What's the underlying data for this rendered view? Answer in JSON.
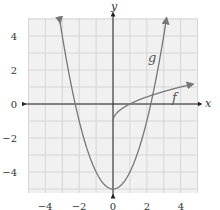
{
  "chart_data": {
    "type": "line",
    "title": "",
    "xlabel": "x",
    "ylabel": "y",
    "xlim": [
      -5,
      5
    ],
    "ylim": [
      -5,
      5
    ],
    "grid": true,
    "xticks": [
      -4,
      -2,
      0,
      2,
      4
    ],
    "yticks": [
      -4,
      -2,
      0,
      2,
      4
    ],
    "xtick_labels": [
      "−4",
      "−2",
      "0",
      "2",
      "4"
    ],
    "ytick_labels": [
      "4",
      "2",
      "0",
      "−2",
      "−4"
    ],
    "series": [
      {
        "name": "g",
        "formula": "x^2 - 5",
        "x": [
          -3.15,
          -3,
          -2.5,
          -2,
          -1.5,
          -1,
          -0.5,
          0,
          0.5,
          1,
          1.5,
          2,
          2.5,
          3,
          3.15
        ],
        "y": [
          4.9,
          4,
          1.25,
          -1,
          -2.75,
          -4,
          -4.75,
          -5,
          -4.75,
          -4,
          -2.75,
          -1,
          1.25,
          4,
          4.9
        ],
        "arrows": "both-ends"
      },
      {
        "name": "f",
        "formula": "sqrt(x) - 1",
        "x": [
          0,
          0.25,
          0.5,
          1,
          1.5,
          2,
          2.5,
          3,
          3.5,
          4,
          4.6
        ],
        "y": [
          -1,
          -0.5,
          -0.29,
          0,
          0.22,
          0.41,
          0.58,
          0.73,
          0.87,
          1,
          1.14
        ],
        "arrows": "end"
      }
    ],
    "annotations": [
      {
        "text": "g",
        "x": 2.3,
        "y": 2.7
      },
      {
        "text": "f",
        "x": 3.7,
        "y": 0.35
      }
    ],
    "colors": {
      "curves": "#777777",
      "axes": "#222222",
      "grid": "#d6d6d6",
      "grid_background": "#f1f1f1"
    }
  },
  "labels": {
    "x_axis": "x",
    "y_axis": "y",
    "g": "g",
    "f": "f",
    "xtick_0": "−4",
    "xtick_1": "−2",
    "xtick_2": "0",
    "xtick_3": "2",
    "xtick_4": "4",
    "ytick_0": "4",
    "ytick_1": "2",
    "ytick_2": "0",
    "ytick_3": "−2",
    "ytick_4": "−4"
  }
}
